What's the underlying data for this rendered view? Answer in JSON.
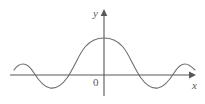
{
  "figure": {
    "title": "",
    "background_color": "#ffffff",
    "curve_color": "#6e6e70",
    "axis_color": "#58585a",
    "labels": {
      "y_axis": "y",
      "x_axis": "x",
      "origin": "0"
    }
  },
  "chart_data": {
    "type": "line",
    "title": "",
    "xlabel": "x",
    "ylabel": "y",
    "grid": false,
    "legend": null,
    "axes": {
      "x_axis_pixel_y": 75,
      "y_axis_pixel_x": 104,
      "x_axis_start_px": 10,
      "x_axis_end_px": 191,
      "y_axis_top_px": 14,
      "x_arrow": "right",
      "y_arrow": "up"
    },
    "xlim": [
      -4.6,
      4.6
    ],
    "ylim": [
      -0.55,
      1.15
    ],
    "x": [
      -4.6,
      -4.4,
      -4.2,
      -4.0,
      -3.8,
      -3.6,
      -3.4,
      -3.2,
      -3.0,
      -2.8,
      -2.6,
      -2.4,
      -2.2,
      -2.0,
      -1.8,
      -1.6,
      -1.4,
      -1.2,
      -1.0,
      -0.8,
      -0.6,
      -0.4,
      -0.2,
      0.0,
      0.2,
      0.4,
      0.6,
      0.8,
      1.0,
      1.2,
      1.4,
      1.6,
      1.8,
      2.0,
      2.2,
      2.4,
      2.6,
      2.8,
      3.0,
      3.2,
      3.4,
      3.6,
      3.8,
      4.0,
      4.2,
      4.4,
      4.6
    ],
    "y": [
      0.12,
      0.21,
      0.27,
      0.29,
      0.27,
      0.21,
      0.12,
      0.01,
      -0.12,
      -0.24,
      -0.33,
      -0.4,
      -0.43,
      -0.42,
      -0.36,
      -0.25,
      -0.09,
      0.11,
      0.33,
      0.56,
      0.77,
      0.92,
      1.0,
      1.02,
      1.0,
      0.92,
      0.77,
      0.56,
      0.33,
      0.11,
      -0.09,
      -0.25,
      -0.36,
      -0.42,
      -0.43,
      -0.4,
      -0.33,
      -0.24,
      -0.12,
      0.01,
      0.12,
      0.21,
      0.27,
      0.29,
      0.27,
      0.21,
      0.12
    ],
    "features": {
      "central_peak": {
        "x": 0.0,
        "y": 1.02,
        "pixel": [
          104,
          38
        ]
      },
      "troughs": [
        {
          "x": -2.2,
          "y": -0.43,
          "pixel": [
            58,
            88
          ]
        },
        {
          "x": 2.2,
          "y": -0.43,
          "pixel": [
            148,
            88
          ]
        }
      ],
      "outer_crests": [
        {
          "x": -4.0,
          "y": 0.29,
          "pixel": [
            23,
            64
          ]
        },
        {
          "x": 4.0,
          "y": 0.29,
          "pixel": [
            181,
            64
          ]
        }
      ],
      "zero_crossings_px": [
        33,
        84,
        124,
        174
      ]
    },
    "curve_path_px": "M 14,70 C 16,67 19,64 23,64 C 27,64 31,68 34,73 C 39,81 44,87 50,88 C 56,89 62,85 67,78 C 74,68 79,54 85,47 C 91,40 97,38 104,38 C 111,38 117,40 123,47 C 129,54 134,68 141,78 C 146,85 152,89 158,88 C 164,87 169,81 174,73 C 177,68 181,64 185,64 C 189,64 192,67 195,70"
  }
}
